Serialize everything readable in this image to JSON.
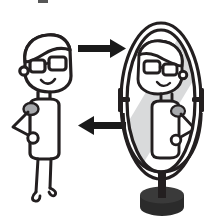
{
  "illustration": {
    "title": "Mirror Reflection Illustration",
    "description": "Cartoon man with glasses standing beside an oval standing mirror, with arrows showing light travelling to the mirror and the reflection coming back",
    "background_color": "#ffffff",
    "ink_color": "#231f20",
    "shade_color": "#a7a9ac",
    "shine_color": "#d9dadb",
    "base_color": "#2b2b2b"
  },
  "figures": {
    "person": {
      "name": "man-with-glasses",
      "facing": "right",
      "parts": [
        "hair",
        "head",
        "ear",
        "glasses-left-lens",
        "glasses-right-lens",
        "mouth",
        "neck",
        "torso",
        "shoulder-pad",
        "arm-on-hip",
        "badge-circle",
        "left-leg",
        "right-leg",
        "left-foot",
        "right-foot"
      ]
    },
    "reflection": {
      "name": "mirrored-man",
      "facing": "left",
      "parts": [
        "hair",
        "head",
        "ear",
        "glasses-left-lens",
        "glasses-right-lens",
        "mouth",
        "neck",
        "torso",
        "shoulder-pad",
        "arm-on-hip",
        "badge-circle"
      ]
    }
  },
  "arrows": [
    {
      "name": "arrow-to-mirror",
      "direction": "right",
      "label": "",
      "color": "#1a1a1a",
      "position": {
        "x": 78,
        "y": 48
      },
      "length": 48
    },
    {
      "name": "arrow-from-mirror",
      "direction": "left",
      "label": "",
      "color": "#1a1a1a",
      "position": {
        "x": 78,
        "y": 125
      },
      "length": 48
    }
  ],
  "mirror": {
    "name": "standing-oval-mirror",
    "frame_shape": "oval",
    "frame_color": "#231f20",
    "glass_color": "#ffffff",
    "shine_color": "#d9dadb",
    "has_pivot_pins": true,
    "pivot_pins": [
      "left-pivot-pin",
      "right-pivot-pin"
    ],
    "stand": {
      "post": "mirror-post",
      "base": "mirror-base",
      "base_color": "#2b2b2b"
    },
    "center": {
      "x": 161,
      "y": 101
    },
    "radius_x": 40,
    "radius_y": 78
  }
}
